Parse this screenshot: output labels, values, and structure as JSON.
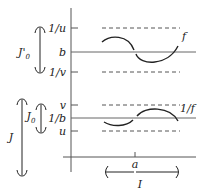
{
  "diagram": {
    "upper_panel": {
      "ticks": [
        "1/u",
        "b",
        "1/v"
      ],
      "curve_label": "f",
      "interval_label": "J'",
      "interval_label_sub": "0"
    },
    "lower_panel": {
      "ticks": [
        "v",
        "1/b",
        "u"
      ],
      "curve_label": "1/f",
      "outer_interval_label": "J",
      "inner_interval_label": "J",
      "inner_interval_label_sub": "0"
    },
    "x_axis": {
      "point_label": "a",
      "interval_label": "I"
    },
    "colors": {
      "ink": "#222222",
      "axis": "#555555",
      "background": "#ffffff"
    }
  }
}
